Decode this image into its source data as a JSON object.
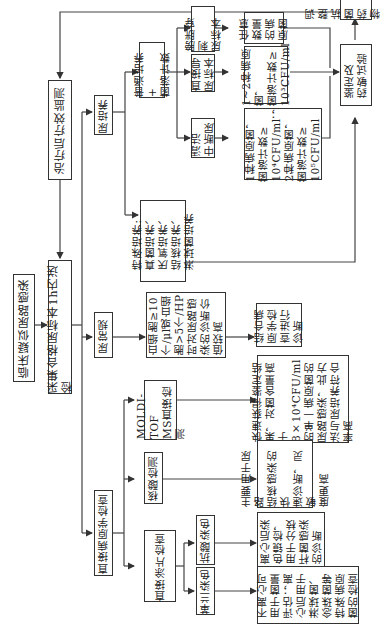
{
  "nodes": {
    "suspected_uti": "临床疑似尿路感染",
    "collect_specimen": "采集合格尿标本1h内送检",
    "post_treatment_monitor": "治疗后疗效监测",
    "urine_culture": "尿培养",
    "urinalysis": "尿常规",
    "direct_pathogen": "直接病原学检查",
    "routine_culture": "普通培养+\n菌落计数",
    "special_culture": "特殊培养:\n真菌培养、\n厌氧培养、\n结核培养、\n淋球菌培养",
    "clean_midstream": "清洁\n中断尿",
    "catheter_urine": "直接导\n尿标本",
    "suprapubic": "膀胱穿刺\n尿标本",
    "midstream_criteria": "1种病原菌，\n菌落计数≥\n10⁴CFU/ml；\n2种病原菌，\n菌落计数≥\n10⁵CFU/ml",
    "catheter_criteria": "1~2种病原菌，\n菌落计数≥\n10³CFU/ml",
    "suprapubic_criteria": "任意\n数量\n的病\n原菌",
    "identification_ast": "鉴定及\n药敏试验",
    "adjust_therapy": "调整抗菌\n药物治疗",
    "wbc_criteria": "白细胞≥10\n个/μl或白细\n胞>5个/HP\n时对尿路感\n染的诊断价\n值较高",
    "combine_pathogen": "结合病\n原学检\n查进行\n诊断",
    "direct_smear": "直接涂片检查",
    "nucleic_acid": "核酸检测",
    "maldi_tof": "MOLDI-TOF\nMS直接检测",
    "gram_stain": "革兰染色",
    "acid_fast_stain": "抗酸染色",
    "gram_note": "不离心可\n用于菌量\n评估；离\n心后用于\n淋球菌、\n念珠菌等\n特殊病原\n菌的检查",
    "acid_fast_note": "离心后染\n色镜检，\n用于分枝\n杆菌感染\n的诊断",
    "nucleic_note": "主要用于尿路\n结核感染的快\n速诊断，灵敏\n度更高",
    "maldi_note": "快速获得鉴定结\n果，对菌含量高\n于8×10⁴CFU/ml\n的单一病原菌的\n尿路感染，此方\n法与尿培养符合\n率高"
  }
}
